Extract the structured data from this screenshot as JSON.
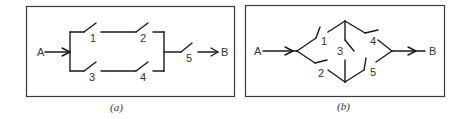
{
  "figures": [
    {
      "id": "a",
      "caption": "(a)",
      "input_node": "A",
      "output_node": "B",
      "switches": [
        "1",
        "2",
        "3",
        "4",
        "5"
      ],
      "description": "Series-parallel network: branch 1-2 in parallel with branch 3-4, then in series with 5"
    },
    {
      "id": "b",
      "caption": "(b)",
      "input_node": "A",
      "output_node": "B",
      "switches": [
        "1",
        "2",
        "3",
        "4",
        "5"
      ],
      "description": "Bridge network: 1 and 2 from A, 4 and 5 to B, 3 as the bridge"
    }
  ]
}
